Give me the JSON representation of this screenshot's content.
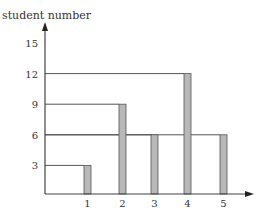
{
  "chart_data": {
    "type": "bar",
    "title": "",
    "ylabel": "student number",
    "xlabel": "",
    "categories": [
      "1",
      "2",
      "3",
      "4",
      "5"
    ],
    "values": [
      3,
      9,
      6,
      12,
      6
    ],
    "yticks": [
      "3",
      "6",
      "9",
      "12",
      "15"
    ],
    "ylim": [
      0,
      15
    ],
    "grid": false,
    "legend": null,
    "annotations": "Horizontal guide lines drawn from the y-axis to the top of each bar (at 3, 9, 6, 12, 6)"
  },
  "colors": {
    "bar_fill": "#b8b8b8",
    "bar_stroke": "#555555",
    "axis": "#444444",
    "guide": "#555555",
    "text": "#333333"
  }
}
